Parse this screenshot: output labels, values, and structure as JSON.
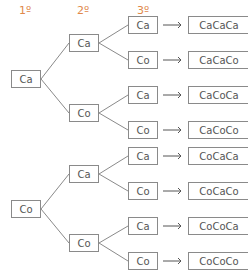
{
  "headers": [
    "1º",
    "2º",
    "3º"
  ],
  "accent_color": "#e0884a",
  "level1": [
    "Ca",
    "Co"
  ],
  "level2": [
    "Ca",
    "Co",
    "Ca",
    "Co"
  ],
  "level3": [
    "Ca",
    "Co",
    "Ca",
    "Co",
    "Ca",
    "Co",
    "Ca",
    "Co"
  ],
  "results": [
    "CaCaCa",
    "CaCaCo",
    "CaCoCa",
    "CaCoCo",
    "CoCaCa",
    "CoCaCo",
    "CoCoCa",
    "CoCoCo"
  ]
}
